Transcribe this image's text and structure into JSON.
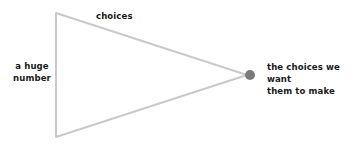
{
  "diagram": {
    "background_color": "#ffffff",
    "stroke_color": "#c9c9c9",
    "dot_color": "#7a7a7a",
    "text_color": "#1a1a1a",
    "labels": {
      "left": "a huge\nnumber",
      "top": "choices",
      "right": "the choices we want\nthem to make"
    },
    "shape": {
      "type": "triangle",
      "points": "56,13 56,137 247,75",
      "stroke_width": 2
    },
    "dot": {
      "cx": 250,
      "cy": 75,
      "r": 5
    }
  }
}
